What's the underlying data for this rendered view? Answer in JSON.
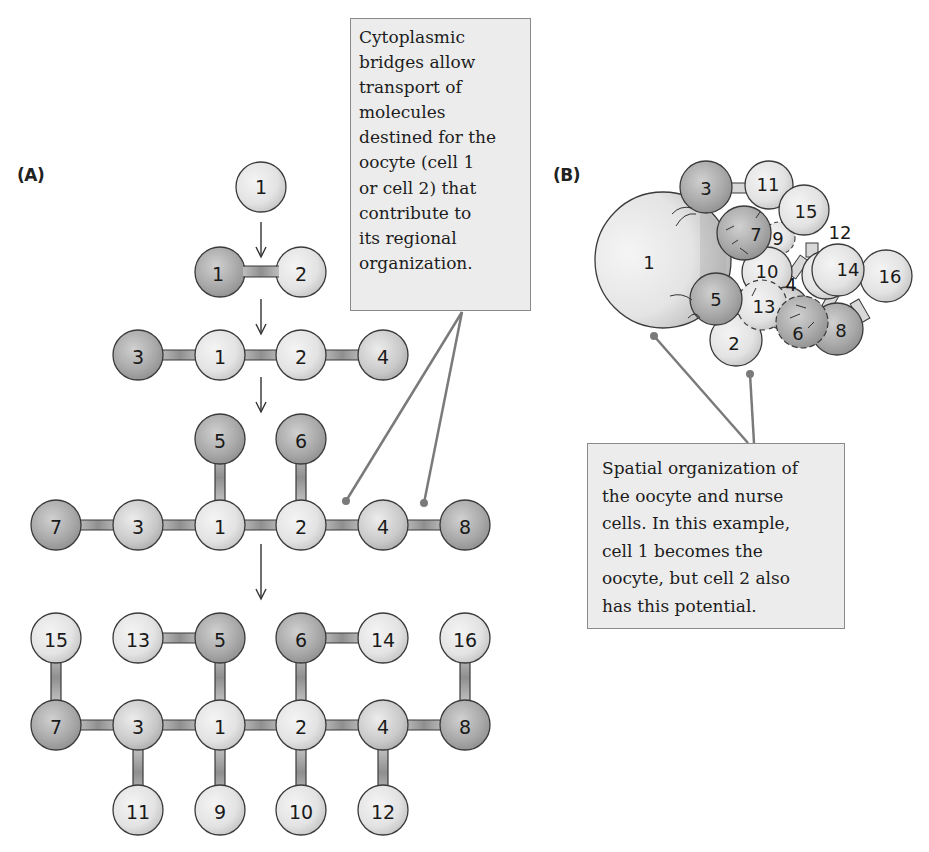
{
  "panels": {
    "a": {
      "label": "(A)",
      "stages": [
        {
          "cells": [
            "1"
          ]
        },
        {
          "cells": [
            "1",
            "2"
          ]
        },
        {
          "cells": [
            "3",
            "1",
            "2",
            "4"
          ]
        },
        {
          "cells": [
            "5",
            "6",
            "7",
            "3",
            "1",
            "2",
            "4",
            "8"
          ]
        },
        {
          "cells": [
            "15",
            "13",
            "5",
            "6",
            "14",
            "16",
            "7",
            "3",
            "1",
            "2",
            "4",
            "8",
            "11",
            "9",
            "10",
            "12"
          ]
        }
      ]
    },
    "b": {
      "label": "(B)",
      "cells": [
        "1",
        "2",
        "3",
        "4",
        "5",
        "6",
        "7",
        "8",
        "9",
        "10",
        "11",
        "12",
        "13",
        "14",
        "15",
        "16"
      ]
    }
  },
  "callouts": {
    "bridges": {
      "lines": [
        "Cytoplasmic",
        "bridges allow",
        "transport of",
        "molecules",
        "destined for the",
        "oocyte (cell 1",
        "or cell 2) that",
        "contribute to",
        "its regional",
        "organization."
      ]
    },
    "spatial": {
      "lines": [
        "Spatial organization of",
        "the oocyte and nurse",
        "cells. In this example,",
        "cell 1 becomes the",
        "oocyte, but cell 2 also",
        "has this potential."
      ]
    }
  },
  "cell_labels": {
    "c1": "1",
    "c2": "2",
    "c3": "3",
    "c4": "4",
    "c5": "5",
    "c6": "6",
    "c7": "7",
    "c8": "8",
    "c9": "9",
    "c10": "10",
    "c11": "11",
    "c12": "12",
    "c13": "13",
    "c14": "14",
    "c15": "15",
    "c16": "16"
  },
  "colors": {
    "light_cell": "#e6e6e6",
    "dark_cell": "#9a9a9a",
    "outline": "#3a3a3a",
    "callout_bg": "#ececec",
    "callout_border": "#8a8a8a",
    "leader_line": "#7a7a7a"
  }
}
